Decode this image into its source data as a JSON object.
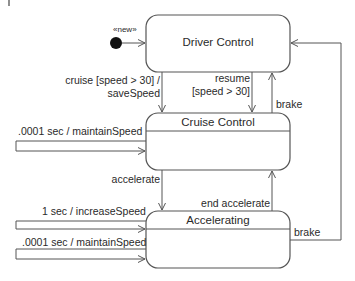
{
  "diagram": {
    "type": "UML state machine",
    "colors": {
      "line": "#555555",
      "text": "#2a2a2a",
      "background": "#ffffff",
      "initial_node": "#111111"
    },
    "initial": {
      "stereotype": "«new»"
    },
    "states": [
      {
        "id": "driver-control",
        "name": "Driver Control",
        "compartment": false
      },
      {
        "id": "cruise-control",
        "name": "Cruise Control",
        "compartment": true
      },
      {
        "id": "accelerating",
        "name": "Accelerating",
        "compartment": true
      }
    ],
    "transitions": [
      {
        "id": "cruise",
        "from": "driver-control",
        "to": "cruise-control",
        "label_line1": "cruise [speed > 30] /",
        "label_line2": "saveSpeed"
      },
      {
        "id": "resume",
        "from": "driver-control",
        "to": "cruise-control",
        "label_line1": "resume",
        "label_line2": "[speed > 30]"
      },
      {
        "id": "brake-cruise",
        "from": "cruise-control",
        "to": "driver-control",
        "label": "brake"
      },
      {
        "id": "maintain-cruise",
        "from": "cruise-control",
        "to": "cruise-control",
        "label": ".0001 sec / maintainSpeed"
      },
      {
        "id": "accelerate",
        "from": "cruise-control",
        "to": "accelerating",
        "label": "accelerate"
      },
      {
        "id": "end-accelerate",
        "from": "accelerating",
        "to": "cruise-control",
        "label": "end accelerate"
      },
      {
        "id": "increase-speed",
        "from": "accelerating",
        "to": "accelerating",
        "label": "1 sec / increaseSpeed"
      },
      {
        "id": "maintain-accel",
        "from": "accelerating",
        "to": "accelerating",
        "label": ".0001 sec / maintainSpeed"
      },
      {
        "id": "brake-accel",
        "from": "accelerating",
        "to": "driver-control",
        "label": "brake"
      }
    ]
  }
}
